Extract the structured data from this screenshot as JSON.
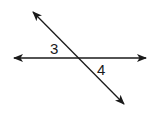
{
  "diagram": {
    "type": "intersecting-lines",
    "stroke_color": "#1a1a1a",
    "background": "#ffffff",
    "lines": [
      {
        "name": "horizontal-line",
        "x1": 14,
        "y1": 58,
        "x2": 146,
        "y2": 58,
        "arrows": "both"
      },
      {
        "name": "transversal-line",
        "x1": 33,
        "y1": 12,
        "x2": 124,
        "y2": 104,
        "arrows": "both"
      }
    ],
    "intersection": {
      "x": 79,
      "y": 58
    },
    "labels": [
      {
        "text": "3",
        "x": 50,
        "y": 41
      },
      {
        "text": "4",
        "x": 97,
        "y": 62
      }
    ]
  }
}
